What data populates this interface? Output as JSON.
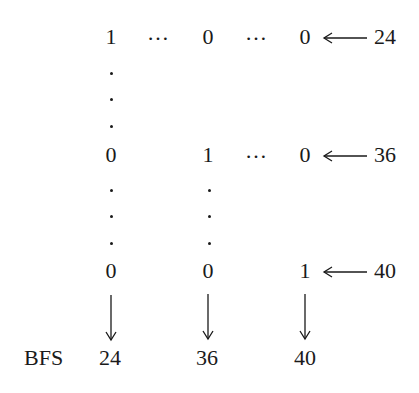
{
  "matrix": {
    "rows": [
      {
        "cells": [
          "1",
          "0",
          "0"
        ],
        "separators": [
          "…",
          "…"
        ],
        "label": "24"
      },
      {
        "cells": [
          "0",
          "1",
          "0"
        ],
        "separators": [
          "",
          "…"
        ],
        "label": "36"
      },
      {
        "cells": [
          "0",
          "0",
          "1"
        ],
        "separators": [
          "",
          ""
        ],
        "label": "40"
      }
    ]
  },
  "bottom": {
    "label": "BFS",
    "values": [
      "24",
      "36",
      "40"
    ]
  }
}
